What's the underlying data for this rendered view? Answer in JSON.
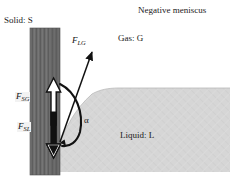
{
  "figure": {
    "title_annotation": "Negative meniscus"
  },
  "labels": {
    "solid": "Solid: S",
    "gas": "Gas: G",
    "liquid": "Liquid: L",
    "negative_meniscus": "Negative meniscus",
    "angle": "α"
  },
  "forces": [
    {
      "key": "F_LG",
      "symbol": "F",
      "subscript": "LG",
      "direction": "up-right",
      "arrow_style": "solid-black-line"
    },
    {
      "key": "F_SG",
      "symbol": "F",
      "subscript": "SG",
      "direction": "up",
      "arrow_style": "white-filled-outline"
    },
    {
      "key": "F_SL",
      "symbol": "F",
      "subscript": "SL",
      "direction": "down",
      "arrow_style": "black-filled-outline"
    }
  ],
  "colors": {
    "solid_wall": "#6e6e6e",
    "solid_wall_dark": "#555555",
    "liquid": "#d4d4d4",
    "gas": "#ffffff",
    "stroke": "#111111",
    "label_text": "#1a1a1a",
    "label_backing": "#f2f2f2"
  },
  "geometry": {
    "wall_x": 30,
    "wall_width": 30,
    "wall_top_y": 28,
    "wall_bottom_y": 175,
    "liquid_left_x": 60,
    "liquid_right_x": 230,
    "liquid_surface_y": 88,
    "liquid_bottom_y": 172,
    "contact_point_x": 60,
    "contact_point_y": 142,
    "contact_angle_deg": 140
  }
}
